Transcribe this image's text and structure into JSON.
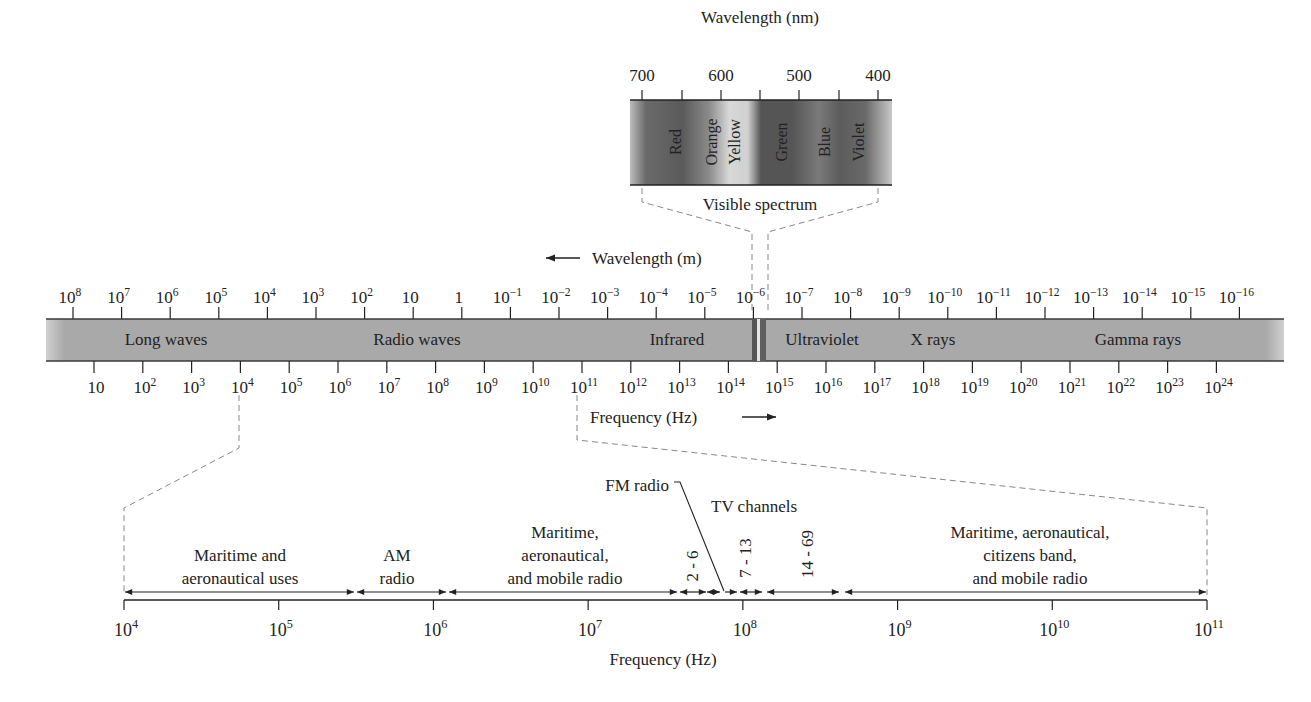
{
  "visible_inset": {
    "axis_title": "Wavelength (nm)",
    "ticks": [
      "700",
      "600",
      "500",
      "400"
    ],
    "bands": [
      "Red",
      "Orange",
      "Yellow",
      "Green",
      "Blue",
      "Violet"
    ],
    "caption": "Visible spectrum"
  },
  "main_band": {
    "wavelength_title": "Wavelength (m)",
    "wavelength_ticks": [
      {
        "base": "10",
        "exp": "8"
      },
      {
        "base": "10",
        "exp": "7"
      },
      {
        "base": "10",
        "exp": "6"
      },
      {
        "base": "10",
        "exp": "5"
      },
      {
        "base": "10",
        "exp": "4"
      },
      {
        "base": "10",
        "exp": "3"
      },
      {
        "base": "10",
        "exp": "2"
      },
      {
        "base": "10",
        "exp": ""
      },
      {
        "base": "1",
        "exp": ""
      },
      {
        "base": "10",
        "exp": "−1"
      },
      {
        "base": "10",
        "exp": "−2"
      },
      {
        "base": "10",
        "exp": "−3"
      },
      {
        "base": "10",
        "exp": "−4"
      },
      {
        "base": "10",
        "exp": "−5"
      },
      {
        "base": "10",
        "exp": "−6"
      },
      {
        "base": "10",
        "exp": "−7"
      },
      {
        "base": "10",
        "exp": "−8"
      },
      {
        "base": "10",
        "exp": "−9"
      },
      {
        "base": "10",
        "exp": "−10"
      },
      {
        "base": "10",
        "exp": "−11"
      },
      {
        "base": "10",
        "exp": "−12"
      },
      {
        "base": "10",
        "exp": "−13"
      },
      {
        "base": "10",
        "exp": "−14"
      },
      {
        "base": "10",
        "exp": "−15"
      },
      {
        "base": "10",
        "exp": "−16"
      }
    ],
    "regions": [
      "Long waves",
      "Radio waves",
      "Infrared",
      "Ultraviolet",
      "X rays",
      "Gamma rays"
    ],
    "frequency_title": "Frequency (Hz)",
    "frequency_ticks": [
      {
        "base": "10",
        "exp": ""
      },
      {
        "base": "10",
        "exp": "2"
      },
      {
        "base": "10",
        "exp": "3"
      },
      {
        "base": "10",
        "exp": "4"
      },
      {
        "base": "10",
        "exp": "5"
      },
      {
        "base": "10",
        "exp": "6"
      },
      {
        "base": "10",
        "exp": "7"
      },
      {
        "base": "10",
        "exp": "8"
      },
      {
        "base": "10",
        "exp": "9"
      },
      {
        "base": "10",
        "exp": "10"
      },
      {
        "base": "10",
        "exp": "11"
      },
      {
        "base": "10",
        "exp": "12"
      },
      {
        "base": "10",
        "exp": "13"
      },
      {
        "base": "10",
        "exp": "14"
      },
      {
        "base": "10",
        "exp": "15"
      },
      {
        "base": "10",
        "exp": "16"
      },
      {
        "base": "10",
        "exp": "17"
      },
      {
        "base": "10",
        "exp": "18"
      },
      {
        "base": "10",
        "exp": "19"
      },
      {
        "base": "10",
        "exp": "20"
      },
      {
        "base": "10",
        "exp": "21"
      },
      {
        "base": "10",
        "exp": "22"
      },
      {
        "base": "10",
        "exp": "23"
      },
      {
        "base": "10",
        "exp": "24"
      }
    ]
  },
  "radio_detail": {
    "axis_title": "Frequency (Hz)",
    "ticks": [
      {
        "base": "10",
        "exp": "4"
      },
      {
        "base": "10",
        "exp": "5"
      },
      {
        "base": "10",
        "exp": "6"
      },
      {
        "base": "10",
        "exp": "7"
      },
      {
        "base": "10",
        "exp": "8"
      },
      {
        "base": "10",
        "exp": "9"
      },
      {
        "base": "10",
        "exp": "10"
      },
      {
        "base": "10",
        "exp": "11"
      }
    ],
    "bands": {
      "maritime_aero": [
        "Maritime and",
        "aeronautical uses"
      ],
      "am": [
        "AM",
        "radio"
      ],
      "maritime_mobile": [
        "Maritime,",
        "aeronautical,",
        "and mobile radio"
      ],
      "tv_low": "2 - 6",
      "tv_mid": "7 - 13",
      "tv_uhf": "14 - 69",
      "upper": [
        "Maritime, aeronautical,",
        "citizens band,",
        "and mobile radio"
      ]
    },
    "fm_label": "FM radio",
    "tv_label": "TV channels"
  },
  "colors": {
    "band_fill": "#a9a9a9",
    "band_edge": "#3a3a3a",
    "ink": "#222222",
    "dash": "#888888"
  }
}
